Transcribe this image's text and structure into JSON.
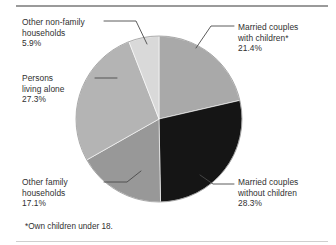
{
  "figure": {
    "footnote": "*Own children under 18."
  },
  "chart_data": {
    "type": "pie",
    "title": "",
    "subtitle": "",
    "xlabel": "",
    "ylabel": "",
    "legend_position": "callouts",
    "grid": false,
    "units": "percent",
    "total": 100.0,
    "labels": [
      "Married couples with children*",
      "Married couples without children",
      "Other family households",
      "Persons living alone",
      "Other non-family households"
    ],
    "values": [
      21.4,
      28.3,
      17.1,
      27.3,
      5.9
    ],
    "colors": [
      "#a9a9a9",
      "#151515",
      "#989898",
      "#b4b4b4",
      "#d9d9d9"
    ],
    "slices": [
      {
        "name": "married-with-children",
        "label_line1": "Married couples",
        "label_line2": "with children*",
        "value_text": "21.4%",
        "value": 21.4,
        "color": "#a9a9a9",
        "start_angle_deg": 0.0,
        "end_angle_deg": 77.04
      },
      {
        "name": "married-without-children",
        "label_line1": "Married couples",
        "label_line2": "without children",
        "value_text": "28.3%",
        "value": 28.3,
        "color": "#151515",
        "start_angle_deg": 77.04,
        "end_angle_deg": 178.92
      },
      {
        "name": "other-family-households",
        "label_line1": "Other family",
        "label_line2": "households",
        "value_text": "17.1%",
        "value": 17.1,
        "color": "#989898",
        "start_angle_deg": 178.92,
        "end_angle_deg": 240.48
      },
      {
        "name": "persons-living-alone",
        "label_line1": "Persons",
        "label_line2": "living alone",
        "value_text": "27.3%",
        "value": 27.3,
        "color": "#b4b4b4",
        "start_angle_deg": 240.48,
        "end_angle_deg": 338.76
      },
      {
        "name": "other-non-family-households",
        "label_line1": "Other non-family",
        "label_line2": "households",
        "value_text": "5.9%",
        "value": 5.9,
        "color": "#d9d9d9",
        "start_angle_deg": 338.76,
        "end_angle_deg": 360.0
      }
    ]
  }
}
